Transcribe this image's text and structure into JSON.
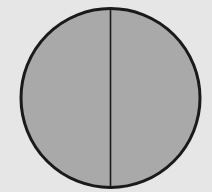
{
  "diagram": {
    "shape": "circle",
    "parts": 2,
    "fill_color": "#a9a9a9",
    "stroke_color": "#1a1a1a",
    "background_color": "#e6e6e6",
    "circle": {
      "cx": 110.5,
      "cy": 98,
      "r": 89.5
    },
    "divider": {
      "orientation": "vertical",
      "x": 110.5
    }
  }
}
